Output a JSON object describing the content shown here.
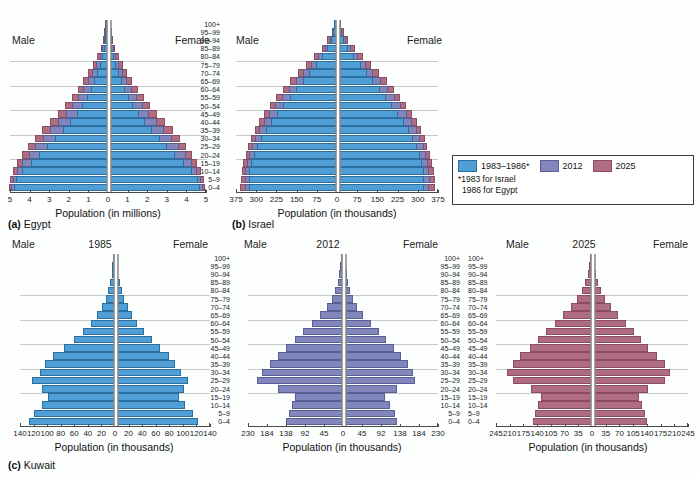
{
  "figure": {
    "background": "#fdfefe",
    "age_groups": [
      "100+",
      "95–99",
      "90–94",
      "85–89",
      "80–84",
      "75–79",
      "70–74",
      "65–69",
      "60–64",
      "55–59",
      "50–54",
      "45–49",
      "40–44",
      "35–39",
      "30–34",
      "25–29",
      "20–24",
      "15–19",
      "10–14",
      "5–9",
      "0–4"
    ],
    "labels": {
      "male": "Male",
      "female": "Female"
    }
  },
  "legend": {
    "position": "middle-right",
    "entries": [
      {
        "label": "1983–1986*",
        "color": "#4f9fd6",
        "name": "series-1983-1986"
      },
      {
        "label": "2012",
        "color": "#8186bd",
        "name": "series-2012"
      },
      {
        "label": "2025",
        "color": "#b06d81",
        "name": "series-2025"
      }
    ],
    "note_line1": "*1983 for Israel",
    "note_line2": "1986 for Egypt"
  },
  "chart_data": [
    {
      "id": "egypt",
      "type": "bar",
      "subtype": "population-pyramid",
      "title": "(a) Egypt",
      "caption_letter": "(a)",
      "caption_name": "Egypt",
      "xlabel": "Population (in millions)",
      "ylabel": "",
      "units": "millions",
      "xlim": [
        0,
        5
      ],
      "xticks": [
        5,
        4,
        3,
        2,
        1,
        0,
        1,
        2,
        3,
        4,
        5
      ],
      "grid": true,
      "gridline_ages": [
        "75–79",
        "60–64",
        "45–49",
        "30–34",
        "15–19"
      ],
      "categories": [
        "100+",
        "95–99",
        "90–94",
        "85–89",
        "80–84",
        "75–79",
        "70–74",
        "65–69",
        "60–64",
        "55–59",
        "50–54",
        "45–49",
        "40–44",
        "35–39",
        "30–34",
        "25–29",
        "20–24",
        "15–19",
        "10–14",
        "5–9",
        "0–4"
      ],
      "series": [
        {
          "name": "1986",
          "color": "#4f9fd6",
          "male": [
            0.01,
            0.03,
            0.06,
            0.12,
            0.22,
            0.33,
            0.47,
            0.62,
            0.79,
            0.99,
            1.22,
            1.5,
            1.83,
            2.2,
            2.6,
            3.0,
            3.4,
            3.85,
            4.3,
            4.6,
            4.7
          ],
          "female": [
            0.01,
            0.03,
            0.06,
            0.12,
            0.21,
            0.32,
            0.45,
            0.6,
            0.77,
            0.96,
            1.19,
            1.46,
            1.78,
            2.14,
            2.54,
            2.93,
            3.32,
            3.76,
            4.2,
            4.5,
            4.6
          ]
        },
        {
          "name": "2012",
          "color": "#8186bd",
          "male": [
            0.02,
            0.05,
            0.1,
            0.19,
            0.33,
            0.5,
            0.7,
            0.92,
            1.15,
            1.42,
            1.72,
            2.06,
            2.44,
            2.85,
            3.24,
            3.6,
            3.95,
            4.28,
            4.55,
            4.75,
            4.85
          ],
          "female": [
            0.02,
            0.05,
            0.1,
            0.18,
            0.32,
            0.48,
            0.68,
            0.89,
            1.12,
            1.38,
            1.68,
            2.01,
            2.38,
            2.78,
            3.17,
            3.52,
            3.86,
            4.18,
            4.45,
            4.65,
            4.75
          ]
        },
        {
          "name": "2025",
          "color": "#b06d81",
          "male": [
            0.03,
            0.08,
            0.15,
            0.27,
            0.45,
            0.66,
            0.9,
            1.16,
            1.44,
            1.75,
            2.08,
            2.45,
            2.85,
            3.26,
            3.64,
            3.98,
            4.28,
            4.55,
            4.75,
            4.88,
            4.95
          ],
          "female": [
            0.03,
            0.08,
            0.14,
            0.26,
            0.44,
            0.64,
            0.88,
            1.13,
            1.41,
            1.71,
            2.04,
            2.4,
            2.79,
            3.19,
            3.56,
            3.9,
            4.19,
            4.46,
            4.66,
            4.79,
            4.86
          ]
        }
      ]
    },
    {
      "id": "israel",
      "type": "bar",
      "subtype": "population-pyramid",
      "title": "(b) Israel",
      "caption_letter": "(b)",
      "caption_name": "Israel",
      "xlabel": "Population (in thousands)",
      "ylabel": "",
      "units": "thousands",
      "xlim": [
        0,
        375
      ],
      "xticks": [
        375,
        300,
        225,
        150,
        75,
        0,
        75,
        150,
        225,
        300,
        375
      ],
      "grid": true,
      "gridline_ages": [
        "75–79",
        "60–64",
        "45–49",
        "30–34",
        "15–19"
      ],
      "categories": [
        "100+",
        "95–99",
        "90–94",
        "85–89",
        "80–84",
        "75–79",
        "70–74",
        "65–69",
        "60–64",
        "55–59",
        "50–54",
        "45–49",
        "40–44",
        "35–39",
        "30–34",
        "25–29",
        "20–24",
        "15–19",
        "10–14",
        "5–9",
        "0–4"
      ],
      "series": [
        {
          "name": "1983",
          "color": "#4f9fd6",
          "male": [
            2,
            6,
            14,
            28,
            48,
            72,
            96,
            120,
            144,
            168,
            192,
            214,
            236,
            256,
            274,
            290,
            302,
            312,
            318,
            320,
            318
          ],
          "female": [
            3,
            8,
            18,
            34,
            55,
            80,
            104,
            128,
            152,
            176,
            198,
            220,
            240,
            260,
            276,
            290,
            300,
            308,
            314,
            316,
            314
          ]
        },
        {
          "name": "2012",
          "color": "#8186bd",
          "male": [
            3,
            9,
            20,
            38,
            62,
            90,
            118,
            146,
            172,
            198,
            222,
            244,
            264,
            282,
            298,
            310,
            320,
            328,
            334,
            336,
            334
          ],
          "female": [
            4,
            12,
            26,
            46,
            72,
            100,
            128,
            156,
            182,
            208,
            230,
            252,
            270,
            288,
            302,
            314,
            324,
            330,
            336,
            338,
            336
          ]
        },
        {
          "name": "2025",
          "color": "#b06d81",
          "male": [
            5,
            13,
            28,
            50,
            78,
            108,
            138,
            166,
            192,
            218,
            242,
            262,
            282,
            298,
            312,
            324,
            332,
            340,
            346,
            350,
            352
          ],
          "female": [
            6,
            17,
            35,
            60,
            90,
            120,
            150,
            178,
            204,
            228,
            250,
            270,
            288,
            304,
            318,
            328,
            338,
            346,
            352,
            356,
            358
          ]
        }
      ]
    },
    {
      "id": "kuwait-1985",
      "type": "bar",
      "subtype": "population-pyramid",
      "title": "(c) Kuwait — 1985",
      "year_label": "1985",
      "xlabel": "Population (in thousands)",
      "ylabel": "",
      "units": "thousands",
      "xlim": [
        0,
        140
      ],
      "xticks": [
        140,
        120,
        100,
        80,
        60,
        40,
        20,
        0,
        20,
        40,
        60,
        80,
        100,
        120,
        140
      ],
      "grid": true,
      "gridline_ages": [
        "75–79",
        "60–64",
        "45–49",
        "30–34",
        "15–19"
      ],
      "categories": [
        "100+",
        "95–99",
        "90–94",
        "85–89",
        "80–84",
        "75–79",
        "70–74",
        "65–69",
        "60–64",
        "55–59",
        "50–54",
        "45–49",
        "40–44",
        "35–39",
        "30–34",
        "25–29",
        "20–24",
        "15–19",
        "10–14",
        "5–9",
        "0–4"
      ],
      "series": [
        {
          "name": "1985",
          "color": "#4f9fd6",
          "male": [
            0.5,
            1,
            2,
            4,
            7,
            11,
            16,
            23,
            32,
            44,
            58,
            72,
            88,
            100,
            108,
            120,
            104,
            96,
            104,
            116,
            124
          ],
          "female": [
            0.5,
            1,
            2,
            4,
            7,
            11,
            16,
            22,
            30,
            40,
            52,
            64,
            76,
            86,
            94,
            104,
            98,
            92,
            100,
            112,
            120
          ]
        }
      ]
    },
    {
      "id": "kuwait-2012",
      "type": "bar",
      "subtype": "population-pyramid",
      "title": "(c) Kuwait — 2012",
      "year_label": "2012",
      "xlabel": "Population (in thousands)",
      "ylabel": "",
      "units": "thousands",
      "xlim": [
        0,
        230
      ],
      "xticks": [
        230,
        184,
        138,
        92,
        45,
        0,
        45,
        92,
        138,
        184,
        230
      ],
      "grid": true,
      "gridline_ages": [
        "75–79",
        "60–64",
        "45–49",
        "30–34",
        "15–19"
      ],
      "categories": [
        "100+",
        "95–99",
        "90–94",
        "85–89",
        "80–84",
        "75–79",
        "70–74",
        "65–69",
        "60–64",
        "55–59",
        "50–54",
        "45–49",
        "40–44",
        "35–39",
        "30–34",
        "25–29",
        "20–24",
        "15–19",
        "10–14",
        "5–9",
        "0–4"
      ],
      "series": [
        {
          "name": "2012",
          "color": "#8186bd",
          "male": [
            1,
            2,
            4,
            8,
            14,
            22,
            34,
            50,
            70,
            92,
            112,
            132,
            152,
            172,
            192,
            204,
            152,
            112,
            118,
            126,
            132
          ],
          "female": [
            1,
            2,
            4,
            8,
            13,
            20,
            30,
            44,
            62,
            82,
            100,
            118,
            136,
            152,
            164,
            170,
            126,
            96,
            110,
            120,
            126
          ]
        }
      ]
    },
    {
      "id": "kuwait-2025",
      "type": "bar",
      "subtype": "population-pyramid",
      "title": "(c) Kuwait — 2025",
      "year_label": "2025",
      "xlabel": "Population (in thousands)",
      "ylabel": "",
      "units": "thousands",
      "xlim": [
        0,
        245
      ],
      "xticks": [
        245,
        210,
        175,
        140,
        105,
        70,
        35,
        0,
        35,
        70,
        105,
        140,
        175,
        210,
        245
      ],
      "grid": true,
      "gridline_ages": [
        "75–79",
        "60–64",
        "45–49",
        "30–34",
        "15–19"
      ],
      "categories": [
        "100+",
        "95–99",
        "90–94",
        "85–89",
        "80–84",
        "75–79",
        "70–74",
        "65–69",
        "60–64",
        "55–59",
        "50–54",
        "45–49",
        "40–44",
        "35–39",
        "30–34",
        "25–29",
        "20–24",
        "15–19",
        "10–14",
        "5–9",
        "0–4"
      ],
      "series": [
        {
          "name": "2025",
          "color": "#b06d81",
          "male": [
            1,
            3,
            6,
            12,
            20,
            32,
            48,
            68,
            90,
            112,
            132,
            152,
            178,
            196,
            212,
            196,
            150,
            126,
            132,
            140,
            146
          ],
          "female": [
            1,
            3,
            6,
            11,
            18,
            29,
            43,
            61,
            81,
            101,
            120,
            138,
            162,
            180,
            194,
            180,
            138,
            116,
            122,
            130,
            136
          ]
        }
      ]
    }
  ]
}
